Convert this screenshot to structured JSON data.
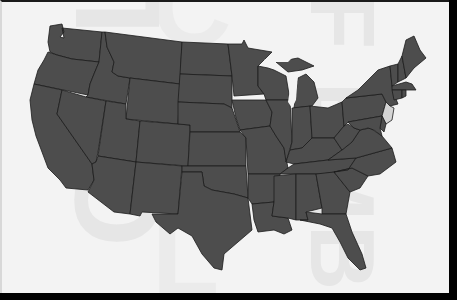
{
  "map": {
    "type": "choropleth",
    "region": "United States (contiguous 48 states)",
    "base_color": "#4d4d4d",
    "highlight_color": "#d4d4d4",
    "border_color": "#1c1c1c",
    "background_color": "#f3f3f3",
    "frame_color": "#000000",
    "highlighted_states": [
      "NJ"
    ],
    "states": [
      "WA",
      "OR",
      "CA",
      "ID",
      "NV",
      "MT",
      "WY",
      "UT",
      "AZ",
      "CO",
      "NM",
      "ND",
      "SD",
      "NE",
      "KS",
      "OK",
      "TX",
      "MN",
      "IA",
      "MO",
      "AR",
      "LA",
      "WI",
      "IL",
      "MI",
      "IN",
      "OH",
      "KY",
      "TN",
      "MS",
      "AL",
      "GA",
      "FL",
      "SC",
      "NC",
      "VA",
      "WV",
      "PA",
      "NY",
      "VT",
      "NH",
      "ME",
      "MA",
      "RI",
      "CT",
      "NJ",
      "DE",
      "MD"
    ]
  },
  "watermark": {
    "left": "OF L",
    "right": "OF EMB",
    "middle": "L",
    "top": "C"
  }
}
